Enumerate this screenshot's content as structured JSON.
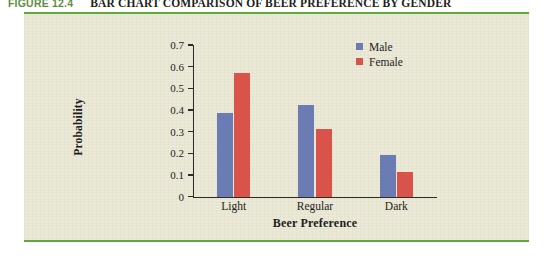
{
  "caption": {
    "number": "FIGURE 12.4",
    "title": "BAR CHART COMPARISON OF BEER PREFERENCE BY GENDER"
  },
  "colors": {
    "male": "#6b7cb4",
    "female": "#d9534a",
    "rule": "#5fa83c",
    "panel": "#e9e7d4",
    "axis": "#2b2b28",
    "caption_number": "#5e8f3e"
  },
  "legend": {
    "position": "top-right",
    "entries": [
      {
        "label": "Male",
        "color": "#6b7cb4"
      },
      {
        "label": "Female",
        "color": "#d9534a"
      }
    ]
  },
  "axes": {
    "y_ticks": [
      "0.7",
      "0.6",
      "0.5",
      "0.4",
      "0.3",
      "0.2",
      "0.1",
      "0"
    ],
    "x_categories": [
      "Light",
      "Regular",
      "Dark"
    ]
  },
  "chart_data": {
    "type": "bar",
    "title": "BAR CHART COMPARISON OF BEER PREFERENCE BY GENDER",
    "xlabel": "Beer Preference",
    "ylabel": "Probability",
    "categories": [
      "Light",
      "Regular",
      "Dark"
    ],
    "series": [
      {
        "name": "Male",
        "color": "#6b7cb4",
        "values": [
          0.385,
          0.425,
          0.19
        ]
      },
      {
        "name": "Female",
        "color": "#d9534a",
        "values": [
          0.57,
          0.31,
          0.115
        ]
      }
    ],
    "ylim": [
      0,
      0.7
    ],
    "ytick_step": 0.1,
    "ytick_labels": [
      "0",
      "0.1",
      "0.2",
      "0.3",
      "0.4",
      "0.5",
      "0.6",
      "0.7"
    ],
    "grid": false,
    "legend_position": "top-right"
  }
}
